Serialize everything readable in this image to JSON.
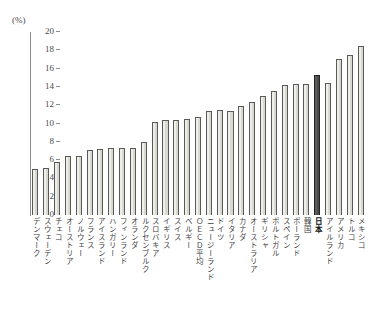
{
  "chart_data": {
    "type": "bar",
    "title": "",
    "subtitle": "",
    "xlabel": "",
    "ylabel": "",
    "unit_label": "(%)",
    "ylim": [
      0,
      20
    ],
    "ytick_values": [
      0,
      2,
      4,
      6,
      8,
      10,
      12,
      14,
      16,
      18,
      20
    ],
    "ytick_labels": [
      "0",
      "2",
      "4",
      "6",
      "8",
      "10",
      "12",
      "14",
      "16",
      "18",
      "20"
    ],
    "grid": false,
    "legend": "none",
    "highlight_category": "日本",
    "colors": {
      "bar_fill": "#d9d9d2",
      "bar_edge": "#595959",
      "highlight_fill": "#4a4a48",
      "highlight_edge": "#232323",
      "axis": "#8d8d8d",
      "text": "#3f3f3f",
      "background": "#ffffff"
    },
    "categories": [
      "デンマーク",
      "スウェーデン",
      "チェコ",
      "オーストリア",
      "ノルウェー",
      "フランス",
      "アイスランド",
      "ハンガリー",
      "フィンランド",
      "オランダ",
      "ルクセンブルク",
      "スロバキア",
      "イギリス",
      "スイス",
      "ベルギー",
      "ＯＥＣＤ平均",
      "ニュージーランド",
      "ドイツ",
      "イタリア",
      "カナダ",
      "オーストラリア",
      "ギリシャ",
      "ポルトガル",
      "スペイン",
      "ポーランド",
      "韓国",
      "日本",
      "アイルランド",
      "アメリカ",
      "トルコ",
      "メキシコ"
    ],
    "values": [
      5.0,
      5.1,
      5.8,
      6.5,
      6.5,
      7.1,
      7.2,
      7.3,
      7.3,
      7.3,
      8.0,
      10.2,
      10.4,
      10.4,
      10.5,
      10.7,
      11.4,
      11.5,
      11.4,
      11.9,
      12.4,
      13.0,
      13.5,
      14.2,
      14.3,
      14.3,
      15.3,
      14.4,
      17.1,
      17.5,
      18.5
    ]
  }
}
